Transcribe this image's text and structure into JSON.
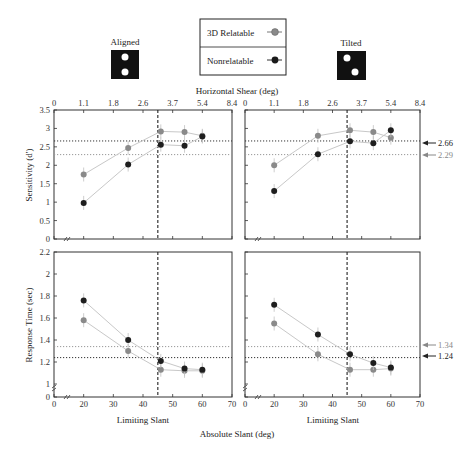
{
  "legend": {
    "items": [
      {
        "label": "3D Relatable",
        "color": "#8a8a8a"
      },
      {
        "label": "Nonrelatable",
        "color": "#1a1a1a"
      }
    ]
  },
  "stimuli": {
    "aligned_label": "Aligned",
    "tilted_label": "Tilted"
  },
  "axes": {
    "top_xlabel": "Horizontal Shear (deg)",
    "top_xticks": [
      "0",
      "1.1",
      "1.8",
      "2.6",
      "3.7",
      "5.4",
      "8.4"
    ],
    "bottom_xlabel": "Limiting Slant",
    "bottom_xticks": [
      "0",
      "20",
      "30",
      "40",
      "50",
      "60",
      "70"
    ],
    "shared_xlabel": "Absolute Slant (deg)",
    "sens_ylabel": "Sensitivity (d')",
    "sens_yticks": [
      "0",
      "0.5",
      "1",
      "1.5",
      "2",
      "2.5",
      "3",
      "3.5"
    ],
    "rt_ylabel": "Response Time (sec)",
    "rt_yticks": [
      "0",
      "1",
      "1.2",
      "1.4",
      "1.6",
      "1.8",
      "2",
      "2.2"
    ]
  },
  "reference_labels": {
    "sens_dark": "2.66",
    "sens_gray": "2.29",
    "rt_gray": "1.34",
    "rt_dark": "1.24"
  },
  "chart_data": [
    {
      "type": "line",
      "title": "Aligned - Sensitivity",
      "xlabel": "Limiting Slant",
      "ylabel": "Sensitivity (d')",
      "x": [
        20,
        35,
        46,
        54,
        60
      ],
      "series": [
        {
          "name": "3D Relatable",
          "values": [
            1.75,
            2.47,
            2.92,
            2.9,
            2.8
          ]
        },
        {
          "name": "Nonrelatable",
          "values": [
            0.98,
            2.02,
            2.56,
            2.53,
            2.78
          ]
        }
      ],
      "reference_lines": {
        "y": [
          2.66,
          2.29
        ],
        "x": 45
      },
      "ylim": [
        0,
        3.5
      ],
      "xlim": [
        0,
        70
      ]
    },
    {
      "type": "line",
      "title": "Tilted - Sensitivity",
      "xlabel": "Limiting Slant",
      "ylabel": "Sensitivity (d')",
      "x": [
        20,
        35,
        46,
        54,
        60
      ],
      "series": [
        {
          "name": "3D Relatable",
          "values": [
            2.0,
            2.8,
            2.95,
            2.9,
            2.75
          ]
        },
        {
          "name": "Nonrelatable",
          "values": [
            1.3,
            2.3,
            2.65,
            2.6,
            2.95
          ]
        }
      ],
      "reference_lines": {
        "y": [
          2.66,
          2.29
        ],
        "x": 45
      },
      "ylim": [
        0,
        3.5
      ],
      "xlim": [
        0,
        70
      ]
    },
    {
      "type": "line",
      "title": "Aligned - Response Time",
      "xlabel": "Limiting Slant",
      "ylabel": "Response Time (sec)",
      "x": [
        20,
        35,
        46,
        54,
        60
      ],
      "series": [
        {
          "name": "3D Relatable",
          "values": [
            1.58,
            1.3,
            1.13,
            1.12,
            1.12
          ]
        },
        {
          "name": "Nonrelatable",
          "values": [
            1.76,
            1.4,
            1.21,
            1.14,
            1.13
          ]
        }
      ],
      "reference_lines": {
        "y": [
          1.34,
          1.24
        ],
        "x": 45
      },
      "ylim": [
        1,
        2.2
      ],
      "xlim": [
        0,
        70
      ]
    },
    {
      "type": "line",
      "title": "Tilted - Response Time",
      "xlabel": "Limiting Slant",
      "ylabel": "Response Time (sec)",
      "x": [
        20,
        35,
        46,
        54,
        60
      ],
      "series": [
        {
          "name": "3D Relatable",
          "values": [
            1.55,
            1.27,
            1.13,
            1.13,
            1.14
          ]
        },
        {
          "name": "Nonrelatable",
          "values": [
            1.72,
            1.45,
            1.27,
            1.19,
            1.15
          ]
        }
      ],
      "reference_lines": {
        "y": [
          1.34,
          1.24
        ],
        "x": 45
      },
      "ylim": [
        1,
        2.2
      ],
      "xlim": [
        0,
        70
      ]
    }
  ]
}
